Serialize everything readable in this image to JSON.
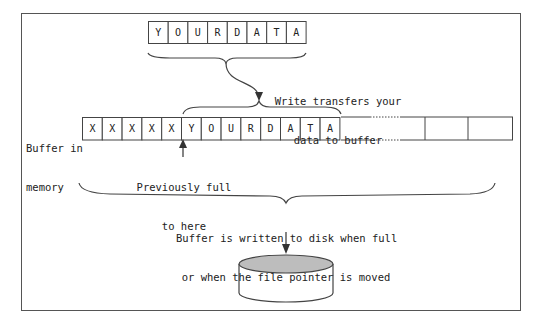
{
  "diagram": {
    "source_array": {
      "cells": [
        "Y",
        "O",
        "U",
        "R",
        "D",
        "A",
        "T",
        "A"
      ]
    },
    "transfer_label": {
      "line1": "Write transfers your",
      "line2": "data to buffer"
    },
    "buffer_label": {
      "line1": "Buffer in",
      "line2": "memory"
    },
    "buffer_cells": [
      "X",
      "X",
      "X",
      "X",
      "X",
      "Y",
      "O",
      "U",
      "R",
      "D",
      "A",
      "T",
      "A"
    ],
    "previous_label": {
      "line1": "Previously full",
      "line2": "to here"
    },
    "flush_label": {
      "line1": "Buffer is written to disk when full",
      "line2": "or when the file pointer is moved"
    },
    "colors": {
      "stroke": "#444444",
      "disk_top": "#bdbdbd",
      "frame": "#555555"
    }
  }
}
